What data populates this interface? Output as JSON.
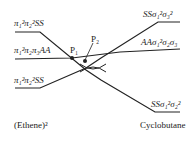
{
  "diagram": {
    "left_states": [
      {
        "label": "π₁²π₂²SS"
      },
      {
        "label": "π₁²π₂π₃AA"
      },
      {
        "label": "π₁²π₂²SS"
      }
    ],
    "right_states": [
      {
        "label": "SSσ₁²σ₃²"
      },
      {
        "label": "AAσ₁²σ₂σ₃"
      },
      {
        "label": "SSσ₁²σ₂²"
      }
    ],
    "points": [
      {
        "label": "P₁"
      },
      {
        "label": "P₂"
      }
    ],
    "left_caption": "(Ethene)²",
    "right_caption": "Cyclobutane"
  }
}
